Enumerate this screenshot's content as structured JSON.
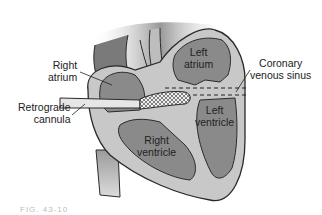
{
  "figure": {
    "caption": "FIG. 43-10",
    "colors": {
      "chamber_fill": "#8a8a8a",
      "wall_fill": "#c8c8c8",
      "outline": "#2a2a2a",
      "background_shadow": "#6e6e6e",
      "cannula_fill": "#e6e6e6"
    }
  },
  "labels": {
    "right_atrium": {
      "line1": "Right",
      "line2": "atrium"
    },
    "retrograde_cannula": {
      "line1": "Retrograde",
      "line2": "cannula"
    },
    "left_atrium": {
      "line1": "Left",
      "line2": "atrium"
    },
    "coronary_sinus": {
      "line1": "Coronary",
      "line2": "venous sinus"
    },
    "left_ventricle": {
      "line1": "Left",
      "line2": "ventricle"
    },
    "right_ventricle": {
      "line1": "Right",
      "line2": "ventricle"
    }
  }
}
